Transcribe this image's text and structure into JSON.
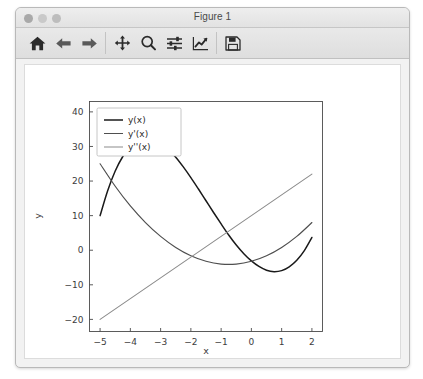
{
  "window": {
    "title": "Figure 1",
    "traffic_lights": [
      "close",
      "minimize",
      "maximize"
    ]
  },
  "toolbar": {
    "buttons": [
      {
        "name": "home-icon",
        "label": "Home",
        "tooltip": "Reset original view"
      },
      {
        "name": "back-arrow-icon",
        "label": "Back",
        "tooltip": "Back to previous view"
      },
      {
        "name": "forward-arrow-icon",
        "label": "Forward",
        "tooltip": "Forward to next view"
      },
      {
        "name": "pan-move-icon",
        "label": "Pan",
        "tooltip": "Pan axes with left mouse, zoom with right"
      },
      {
        "name": "zoom-magnifier-icon",
        "label": "Zoom",
        "tooltip": "Zoom to rectangle"
      },
      {
        "name": "subplot-sliders-icon",
        "label": "Subplots",
        "tooltip": "Configure subplots"
      },
      {
        "name": "edit-curve-icon",
        "label": "Edit",
        "tooltip": "Edit axis, curve and image parameters"
      },
      {
        "name": "save-floppy-icon",
        "label": "Save",
        "tooltip": "Save the figure"
      }
    ]
  },
  "colors": {
    "series_y": "#1a1a1a",
    "series_dy": "#4f4f4f",
    "series_d2y": "#8c8c8c",
    "axis": "#4a4a4a",
    "figure_background": "#ffffff",
    "window_background": "#f2f2f2",
    "titlebar": "#e8e8e8"
  },
  "chart_data": {
    "type": "line",
    "title": "",
    "xlabel": "x",
    "ylabel": "y",
    "xlim": [
      -5.35,
      2.35
    ],
    "ylim": [
      -23.5,
      43.0
    ],
    "xticks": [
      -5,
      -4,
      -3,
      -2,
      -1,
      0,
      1,
      2
    ],
    "xticklabels": [
      "−5",
      "−4",
      "−3",
      "−2",
      "−1",
      "0",
      "1",
      "2"
    ],
    "yticks": [
      -20,
      -10,
      0,
      10,
      20,
      30,
      40
    ],
    "yticklabels": [
      "−20",
      "−10",
      "0",
      "10",
      "20",
      "30",
      "40"
    ],
    "grid": false,
    "legend_position": "upper left",
    "series": [
      {
        "name": "y(x)",
        "color": "#1a1a1a",
        "x": [
          -5.0,
          -4.75,
          -4.5,
          -4.25,
          -4.0,
          -3.75,
          -3.5,
          -3.25,
          -3.0,
          -2.75,
          -2.5,
          -2.25,
          -2.0,
          -1.75,
          -1.5,
          -1.25,
          -1.0,
          -0.75,
          -0.5,
          -0.25,
          0.0,
          0.25,
          0.5,
          0.75,
          1.0,
          1.25,
          1.5,
          1.75,
          2.0
        ],
        "values": [
          10.0,
          17.2,
          22.9,
          27.1,
          30.0,
          31.7,
          32.4,
          32.1,
          31.0,
          29.2,
          26.9,
          24.1,
          21.0,
          17.7,
          14.3,
          10.9,
          7.6,
          4.4,
          1.5,
          -1.0,
          -3.1,
          -4.7,
          -5.8,
          -6.2,
          -5.9,
          -4.8,
          -2.9,
          -0.1,
          3.7
        ]
      },
      {
        "name": "y'(x)",
        "color": "#4f4f4f",
        "x": [
          -5.0,
          -4.5,
          -4.0,
          -3.5,
          -3.0,
          -2.5,
          -2.0,
          -1.5,
          -1.0,
          -0.5,
          0.0,
          0.5,
          1.0,
          1.5,
          2.0
        ],
        "values": [
          25.0,
          18.5,
          12.8,
          8.0,
          4.0,
          0.8,
          -1.6,
          -3.2,
          -4.0,
          -4.0,
          -3.2,
          -1.6,
          0.8,
          4.0,
          8.0
        ]
      },
      {
        "name": "y''(x)",
        "color": "#8c8c8c",
        "x": [
          -5.0,
          2.0
        ],
        "values": [
          -20.0,
          22.0
        ]
      }
    ],
    "legend_entries": [
      "y(x)",
      "y'(x)",
      "y''(x)"
    ]
  }
}
